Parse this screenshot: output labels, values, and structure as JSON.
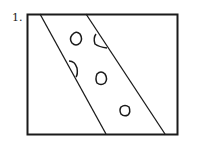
{
  "figure": {
    "label": "1.",
    "colors": {
      "stroke": "#1a1a1a",
      "background": "#ffffff"
    }
  }
}
